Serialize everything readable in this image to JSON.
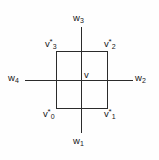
{
  "figure": {
    "type": "geometric-diagram",
    "background_color": "#fefefe",
    "stroke_color": "#2b2b2b",
    "text_color": "#171717"
  },
  "axes": {
    "top": {
      "base": "w",
      "sub": "3",
      "sup": ""
    },
    "right": {
      "base": "w",
      "sub": "2",
      "sup": ""
    },
    "bottom": {
      "base": "w",
      "sub": "1",
      "sup": ""
    },
    "left": {
      "base": "w",
      "sub": "4",
      "sup": ""
    }
  },
  "vertices": {
    "bottom_left": {
      "base": "v",
      "sub": "0",
      "sup": "*"
    },
    "bottom_right": {
      "base": "v",
      "sub": "1",
      "sup": "*"
    },
    "top_right": {
      "base": "v",
      "sub": "2",
      "sup": "*"
    },
    "top_left": {
      "base": "v",
      "sub": "3",
      "sup": "*"
    }
  },
  "center": {
    "base": "v",
    "sub": "",
    "sup": ""
  }
}
